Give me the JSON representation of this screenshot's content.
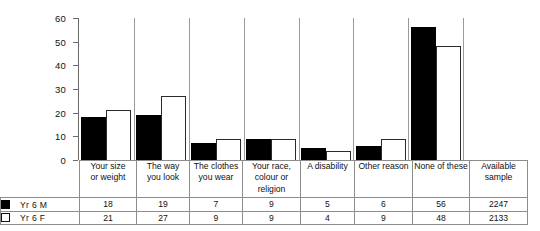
{
  "chart_data": {
    "type": "bar",
    "title": "",
    "xlabel": "",
    "ylabel": "",
    "ylim": [
      0,
      60
    ],
    "yticks": [
      0,
      10,
      20,
      30,
      40,
      50,
      60
    ],
    "grid": false,
    "legend_position": "bottom-left-table",
    "categories": [
      "Your size or weight",
      "The way you look",
      "The clothes you wear",
      "Your race, colour or religion",
      "A disability",
      "Other reason",
      "None of these"
    ],
    "series": [
      {
        "name": "Yr 6 M",
        "values": [
          18,
          19,
          7,
          9,
          5,
          6,
          56
        ],
        "color": "#000000"
      },
      {
        "name": "Yr 6 F",
        "values": [
          21,
          27,
          9,
          9,
          4,
          9,
          48
        ],
        "color": "#ffffff"
      }
    ]
  },
  "table": {
    "category_headers": [
      [
        "Your size",
        "or weight"
      ],
      [
        "The way",
        "you look"
      ],
      [
        "The clothes",
        "you wear"
      ],
      [
        "Your race,",
        "colour or",
        "religion"
      ],
      [
        "A disability"
      ],
      [
        "Other reason"
      ],
      [
        "None of these"
      ],
      [
        "Available",
        "sample"
      ]
    ],
    "rows": [
      {
        "legend_label": "Yr 6 M",
        "swatch": "filled-black-square",
        "values": [
          "18",
          "19",
          "7",
          "9",
          "5",
          "6",
          "56",
          "2247"
        ]
      },
      {
        "legend_label": "Yr 6 F",
        "swatch": "open-white-square",
        "values": [
          "21",
          "27",
          "9",
          "9",
          "4",
          "9",
          "48",
          "2133"
        ]
      }
    ]
  },
  "axis": {
    "tick_labels": [
      "60",
      "50",
      "40",
      "30",
      "20",
      "10",
      "0"
    ]
  }
}
